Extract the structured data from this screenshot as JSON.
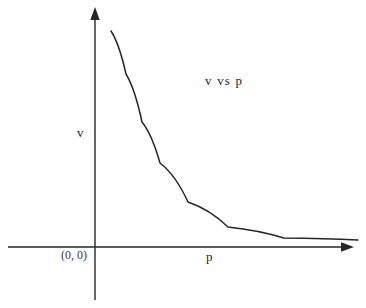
{
  "figure": {
    "background_color": "#ffffff",
    "ink_color": "#262626",
    "width": 366,
    "height": 308
  },
  "chart_data": {
    "type": "line",
    "title": "v  vs  p",
    "xlabel": "p",
    "ylabel": "v",
    "origin_label": "(0, 0)",
    "grid": false,
    "legend": null,
    "axes": {
      "x_axis": {
        "label": "p",
        "has_arrow": true,
        "tick_labels": [],
        "range_shown": "0 to positive (unitless)"
      },
      "y_axis": {
        "label": "v",
        "has_arrow": true,
        "tick_labels": [],
        "range_shown": "0 to positive (unitless)"
      }
    },
    "annotations": [
      {
        "text": "v  vs  p",
        "role": "title"
      },
      {
        "text": "(0, 0)",
        "role": "origin-marker"
      }
    ],
    "series": [
      {
        "name": "v vs p",
        "relationship": "inverse proportion (v = k / p), rectangular hyperbola",
        "color": "#262626",
        "x": [
          0.3,
          0.35,
          0.4,
          0.5,
          0.6,
          0.75,
          0.9,
          1.1,
          1.35,
          1.65,
          2.0,
          2.45,
          3.0,
          3.7,
          4.55,
          5.6,
          6.9,
          8.5
        ],
        "values": [
          7.2,
          6.17,
          5.4,
          4.32,
          3.6,
          2.88,
          2.4,
          1.96,
          1.6,
          1.31,
          1.08,
          0.88,
          0.72,
          0.58,
          0.47,
          0.39,
          0.31,
          0.25
        ]
      }
    ],
    "curve_pixel_path": {
      "start": [
        111,
        31
      ],
      "control_points": [
        [
          126,
          74
        ],
        [
          142,
          122
        ],
        [
          160,
          163
        ],
        [
          188,
          202
        ],
        [
          228,
          227
        ],
        [
          284,
          238
        ],
        [
          358,
          240
        ]
      ],
      "end": [
        358,
        240
      ],
      "asymptote_y_px": 241
    }
  }
}
